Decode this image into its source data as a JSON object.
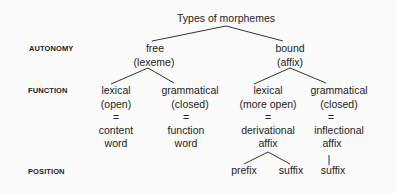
{
  "diagram": {
    "title": "Types of morphemes",
    "row_labels": {
      "autonomy": "AUTONOMY",
      "function": "FUNCTION",
      "position": "POSITION"
    },
    "autonomy": {
      "free": {
        "line1": "free",
        "line2": "(lexeme)"
      },
      "bound": {
        "line1": "bound",
        "line2": "(affix)"
      }
    },
    "function": [
      {
        "line1": "lexical",
        "line2": "(open)",
        "eq": "=",
        "line3": "content",
        "line4": "word"
      },
      {
        "line1": "grammatical",
        "line2": "(closed)",
        "eq": "=",
        "line3": "function",
        "line4": "word"
      },
      {
        "line1": "lexical",
        "line2": "(more open)",
        "eq": "=",
        "line3": "derivational",
        "line4": "affix"
      },
      {
        "line1": "grammatical",
        "line2": "(closed)",
        "eq": "=",
        "line3": "inflectional",
        "line4": "affix"
      }
    ],
    "position": [
      {
        "label": "prefix"
      },
      {
        "label": "suffix"
      },
      {
        "label": "suffix"
      }
    ]
  }
}
